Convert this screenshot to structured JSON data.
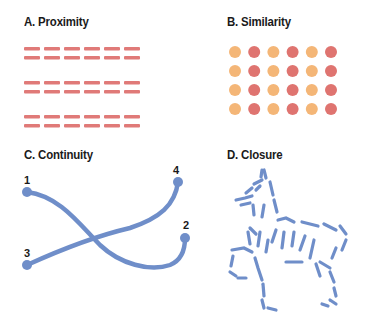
{
  "panels": {
    "a": {
      "title": "A. Proximity",
      "dash_color": "#e07a78",
      "groups": 3,
      "rows_per_group": 2,
      "dashes_per_row": 6
    },
    "b": {
      "title": "B. Similarity",
      "colors": [
        "#f4b677",
        "#df7470"
      ],
      "rows": 4,
      "cols": 6
    },
    "c": {
      "title": "C. Continuity",
      "line_color": "#6f8ec9",
      "labels": [
        "1",
        "2",
        "3",
        "4"
      ]
    },
    "d": {
      "title": "D. Closure",
      "figure": "horse-outline",
      "color": "#6f8ec9"
    }
  }
}
